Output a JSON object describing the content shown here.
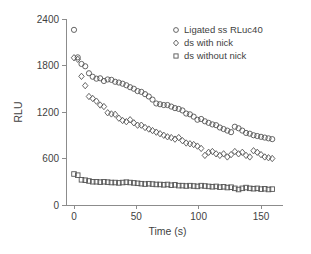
{
  "chart_data": {
    "type": "scatter",
    "title": "",
    "xlabel": "Time (s)",
    "ylabel": "RLU",
    "xlim": [
      -8,
      168
    ],
    "ylim": [
      0,
      2400
    ],
    "xticks": [
      0,
      50,
      100,
      150
    ],
    "yticks": [
      0,
      600,
      1200,
      1800,
      2400
    ],
    "xtick_labels": [
      "0",
      "50",
      "100",
      "150"
    ],
    "ytick_labels": [
      "0",
      "600",
      "1200",
      "1800",
      "2400"
    ],
    "grid": false,
    "legend_position": "top-right",
    "series": [
      {
        "name": "Ligated ss RLuc40",
        "marker": "circle",
        "x": [
          0,
          3,
          6,
          9,
          12,
          15,
          18,
          21,
          24,
          27,
          30,
          33,
          36,
          39,
          42,
          45,
          48,
          51,
          54,
          57,
          60,
          63,
          66,
          69,
          72,
          75,
          78,
          81,
          84,
          87,
          90,
          93,
          96,
          99,
          102,
          105,
          108,
          111,
          114,
          117,
          120,
          123,
          126,
          129,
          132,
          135,
          138,
          141,
          144,
          147,
          150,
          153,
          156,
          159
        ],
        "y": [
          2260,
          1905,
          1820,
          1790,
          1700,
          1655,
          1630,
          1635,
          1600,
          1620,
          1615,
          1590,
          1580,
          1565,
          1545,
          1520,
          1500,
          1470,
          1460,
          1430,
          1400,
          1360,
          1310,
          1300,
          1290,
          1290,
          1270,
          1250,
          1240,
          1220,
          1180,
          1170,
          1140,
          1100,
          1110,
          1080,
          1060,
          1040,
          1030,
          1000,
          980,
          960,
          940,
          1010,
          990,
          960,
          930,
          920,
          900,
          890,
          880,
          870,
          860,
          850
        ]
      },
      {
        "name": "ds with nick",
        "marker": "diamond",
        "x": [
          0,
          3,
          6,
          9,
          12,
          15,
          18,
          21,
          24,
          27,
          30,
          33,
          36,
          39,
          42,
          45,
          48,
          51,
          54,
          57,
          60,
          63,
          66,
          69,
          72,
          75,
          78,
          81,
          84,
          87,
          90,
          93,
          96,
          99,
          102,
          105,
          108,
          111,
          114,
          117,
          120,
          123,
          126,
          129,
          132,
          135,
          138,
          141,
          144,
          147,
          150,
          153,
          156,
          159
        ],
        "y": [
          1900,
          1880,
          1660,
          1540,
          1400,
          1375,
          1340,
          1290,
          1270,
          1190,
          1175,
          1170,
          1120,
          1090,
          1075,
          1100,
          1060,
          1030,
          1030,
          1000,
          980,
          960,
          940,
          920,
          900,
          880,
          870,
          850,
          870,
          830,
          800,
          790,
          780,
          760,
          730,
          640,
          680,
          690,
          660,
          640,
          660,
          620,
          650,
          690,
          660,
          680,
          640,
          620,
          700,
          680,
          650,
          620,
          610,
          600
        ]
      },
      {
        "name": "ds without nick",
        "marker": "square",
        "x": [
          0,
          3,
          6,
          9,
          12,
          15,
          18,
          21,
          24,
          27,
          30,
          33,
          36,
          39,
          42,
          45,
          48,
          51,
          54,
          57,
          60,
          63,
          66,
          69,
          72,
          75,
          78,
          81,
          84,
          87,
          90,
          93,
          96,
          99,
          102,
          105,
          108,
          111,
          114,
          117,
          120,
          123,
          126,
          129,
          132,
          135,
          138,
          141,
          144,
          147,
          150,
          153,
          156,
          159
        ],
        "y": [
          400,
          385,
          325,
          320,
          310,
          300,
          300,
          295,
          300,
          295,
          290,
          290,
          285,
          290,
          295,
          290,
          285,
          280,
          275,
          270,
          275,
          270,
          265,
          265,
          260,
          265,
          255,
          260,
          250,
          250,
          245,
          250,
          245,
          240,
          250,
          245,
          240,
          235,
          240,
          230,
          235,
          225,
          230,
          215,
          200,
          215,
          225,
          215,
          210,
          215,
          205,
          210,
          200,
          205
        ]
      }
    ],
    "legend": [
      {
        "label": "Ligated ss RLuc40",
        "marker": "circle"
      },
      {
        "label": "ds with nick",
        "marker": "diamond"
      },
      {
        "label": "ds without nick",
        "marker": "square"
      }
    ],
    "colors": {
      "marker_stroke": "#555555",
      "axis": "#8c8c8c",
      "text": "#3f3f3f",
      "background": "#ffffff"
    }
  }
}
